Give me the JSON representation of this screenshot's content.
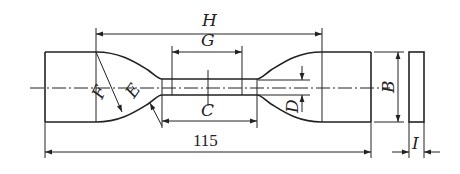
{
  "figure": {
    "stroke_color": "#222222",
    "background": "#ffffff"
  },
  "dimensions": {
    "overall_length": "115",
    "H": "H",
    "G": "G",
    "C": "C",
    "B": "B",
    "D": "D",
    "E": "E",
    "F": "F",
    "I": "I"
  }
}
